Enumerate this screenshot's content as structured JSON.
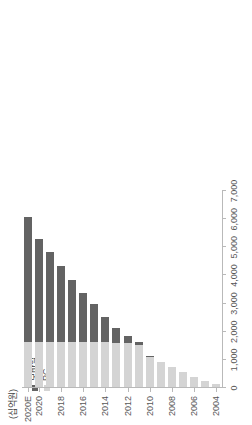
{
  "chart_data": {
    "type": "bar",
    "subtype": "stacked-horizontal",
    "orientation": "rotated-90ccw",
    "title": "",
    "subtitle": "",
    "unit_caption": "(십억원)",
    "xlabel": "",
    "ylabel": "",
    "categories": [
      "2004",
      "2005",
      "2006",
      "2007",
      "2008",
      "2009",
      "2010",
      "2011",
      "2012",
      "2013",
      "2014",
      "2015",
      "2016",
      "2017",
      "2018",
      "2019",
      "2020",
      "2020E"
    ],
    "tick_categories": [
      "2004",
      "2006",
      "2008",
      "2010",
      "2012",
      "2014",
      "2016",
      "2018",
      "2020",
      "2020E"
    ],
    "value_axis_ticks": [
      "0",
      "1,000",
      "2,000",
      "3,000",
      "4,000",
      "5,000",
      "6,000",
      "7,000"
    ],
    "value_axis_tick_values": [
      0,
      1000,
      2000,
      3000,
      4000,
      5000,
      6000,
      7000
    ],
    "ylim": [
      0,
      7000
    ],
    "grid": false,
    "legend_position": "left-middle",
    "series": [
      {
        "name": "모바일",
        "key": "mobile",
        "color": "#636363",
        "values": [
          0,
          0,
          0,
          0,
          0,
          0,
          30,
          110,
          230,
          500,
          900,
          1350,
          1750,
          2200,
          2700,
          3180,
          3660,
          4430
        ]
      },
      {
        "name": "PC",
        "key": "pc",
        "color": "#d4d4d4",
        "values": [
          110,
          210,
          350,
          520,
          700,
          880,
          1070,
          1500,
          1570,
          1580,
          1600,
          1610,
          1600,
          1600,
          1600,
          1600,
          1590,
          1610
        ]
      }
    ],
    "totals": [
      110,
      210,
      350,
      520,
      700,
      880,
      1100,
      1610,
      1800,
      2080,
      2500,
      2960,
      3350,
      3800,
      4300,
      4780,
      5250,
      6040
    ]
  },
  "legend": {
    "items": [
      {
        "label": "모바일",
        "color": "#636363"
      },
      {
        "label": "PC",
        "color": "#d4d4d4"
      }
    ]
  }
}
